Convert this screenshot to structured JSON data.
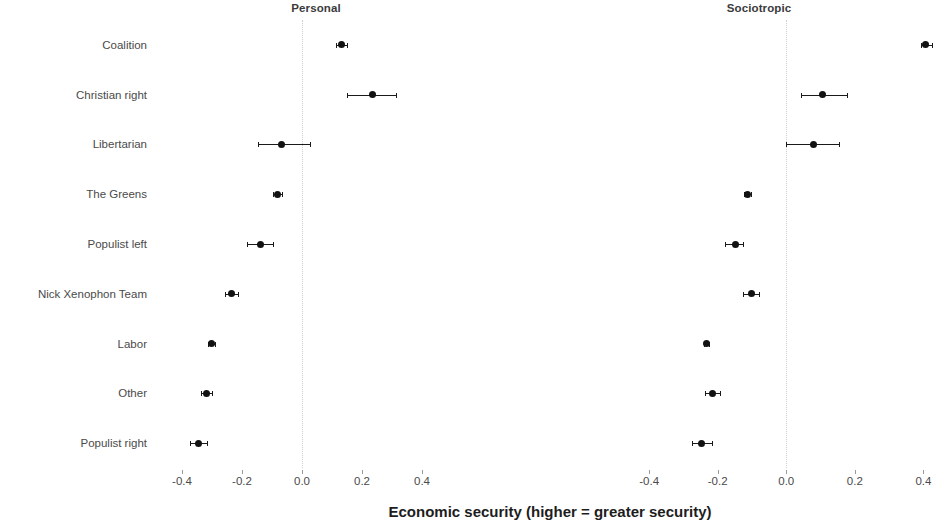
{
  "chart_data": {
    "type": "scatter",
    "title": "",
    "xlabel": "Economic security (higher = greater security)",
    "ylabel": "",
    "grid": false,
    "legend": null,
    "panels": [
      {
        "name": "Personal",
        "xlim": [
          -0.5,
          0.5
        ],
        "xticks": [
          -0.4,
          -0.2,
          0.0,
          0.2,
          0.4
        ],
        "xticklabels": [
          "-0.4",
          "-0.2",
          "0.0",
          "0.2",
          "0.4"
        ],
        "reference_line": 0.0,
        "points": [
          {
            "category": "Coalition",
            "estimate": 0.13,
            "ci_low": 0.112,
            "ci_high": 0.15
          },
          {
            "category": "Christian right",
            "estimate": 0.235,
            "ci_low": 0.15,
            "ci_high": 0.312
          },
          {
            "category": "Libertarian",
            "estimate": -0.068,
            "ci_low": -0.148,
            "ci_high": 0.028
          },
          {
            "category": "The Greens",
            "estimate": -0.082,
            "ci_low": -0.098,
            "ci_high": -0.066
          },
          {
            "category": "Populist left",
            "estimate": -0.14,
            "ci_low": -0.182,
            "ci_high": -0.098
          },
          {
            "category": "Nick Xenophon Team",
            "estimate": -0.236,
            "ci_low": -0.258,
            "ci_high": -0.214
          },
          {
            "category": "Labor",
            "estimate": -0.302,
            "ci_low": -0.314,
            "ci_high": -0.29
          },
          {
            "category": "Other",
            "estimate": -0.32,
            "ci_low": -0.338,
            "ci_high": -0.3
          },
          {
            "category": "Populist right",
            "estimate": -0.344,
            "ci_low": -0.372,
            "ci_high": -0.316
          }
        ]
      },
      {
        "name": "Sociotropic",
        "xlim": [
          -0.52,
          0.46
        ],
        "xticks": [
          -0.4,
          -0.2,
          0.0,
          0.2,
          0.4
        ],
        "xticklabels": [
          "-0.4",
          "-0.2",
          "0.0",
          "0.2",
          "0.4"
        ],
        "reference_line": 0.0,
        "points": [
          {
            "category": "Coalition",
            "estimate": 0.405,
            "ci_low": 0.392,
            "ci_high": 0.425
          },
          {
            "category": "Christian right",
            "estimate": 0.107,
            "ci_low": 0.042,
            "ci_high": 0.176
          },
          {
            "category": "Libertarian",
            "estimate": 0.078,
            "ci_low": -0.002,
            "ci_high": 0.155
          },
          {
            "category": "The Greens",
            "estimate": -0.112,
            "ci_low": -0.122,
            "ci_high": -0.102
          },
          {
            "category": "Populist left",
            "estimate": -0.148,
            "ci_low": -0.18,
            "ci_high": -0.126
          },
          {
            "category": "Nick Xenophon Team",
            "estimate": -0.102,
            "ci_low": -0.126,
            "ci_high": -0.08
          },
          {
            "category": "Labor",
            "estimate": -0.232,
            "ci_low": -0.24,
            "ci_high": -0.224
          },
          {
            "category": "Other",
            "estimate": -0.216,
            "ci_low": -0.236,
            "ci_high": -0.192
          },
          {
            "category": "Populist right",
            "estimate": -0.246,
            "ci_low": -0.276,
            "ci_high": -0.216
          }
        ]
      }
    ],
    "categories": [
      "Coalition",
      "Christian right",
      "Libertarian",
      "The Greens",
      "Populist left",
      "Nick Xenophon Team",
      "Labor",
      "Other",
      "Populist right"
    ]
  }
}
